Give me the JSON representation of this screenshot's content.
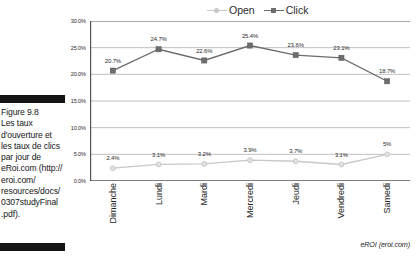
{
  "caption": {
    "text": "Figure 9.8\nLes taux\nd'ouverture et\nles taux de clics\npar jour de\neRoi.com (http://\neroi.com/\nresources/docs/\n0307studyFinal\n.pdf)."
  },
  "source_note": "eROI (eroi.com)",
  "colors": {
    "open_series": "#c8c8c8",
    "click_series": "#6d6d6d",
    "gridline": "#b9b9b9",
    "axis": "#555555",
    "rule_bar": "#141414",
    "text": "#1a1a1a"
  },
  "legend": {
    "position": "top",
    "entries": [
      {
        "label": "Open",
        "color": "#c8c8c8",
        "marker": "circle"
      },
      {
        "label": "Click",
        "color": "#6d6d6d",
        "marker": "square"
      }
    ]
  },
  "chart_data": {
    "type": "line",
    "title": "",
    "xlabel": "",
    "ylabel": "",
    "ylim": [
      0,
      30
    ],
    "ytick_labels": [
      "30.0%",
      "25.0%",
      "20.0%",
      "15.0%",
      "10.0%",
      "5.0%",
      "0.0%"
    ],
    "ytick_values": [
      30,
      25,
      20,
      15,
      10,
      5,
      0
    ],
    "grid": true,
    "categories": [
      "Dimanche",
      "Lundi",
      "Mardi",
      "Mercredi",
      "Jeudi",
      "Vendredi",
      "Samedi"
    ],
    "series": [
      {
        "name": "Open",
        "color": "#c8c8c8",
        "marker": "circle",
        "values": [
          2.4,
          3.1,
          3.2,
          3.9,
          3.7,
          3.1,
          5.0
        ],
        "labels": [
          "2.4%",
          "3.1%",
          "3.2%",
          "3.9%",
          "3.7%",
          "3.1%",
          "5%"
        ]
      },
      {
        "name": "Click",
        "color": "#6d6d6d",
        "marker": "square",
        "values": [
          20.7,
          24.7,
          22.6,
          25.4,
          23.6,
          23.1,
          18.7
        ],
        "labels": [
          "20.7%",
          "24.7%",
          "22.6%",
          "25.4%",
          "23.6%",
          "23.1%",
          "18.7%"
        ]
      }
    ]
  }
}
